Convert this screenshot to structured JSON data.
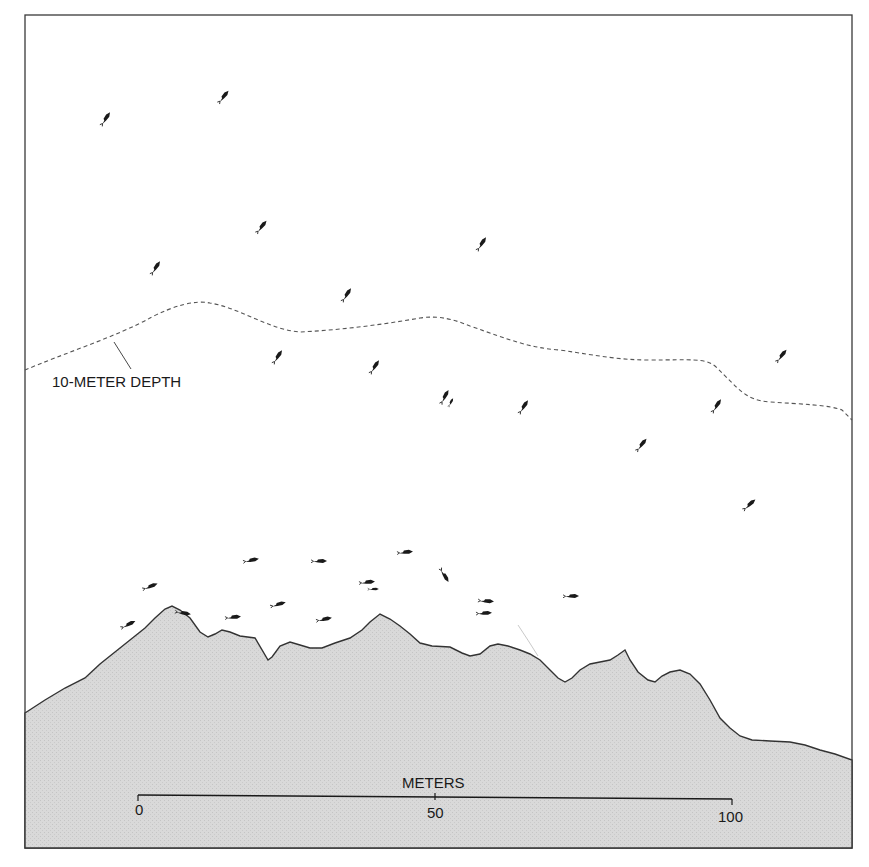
{
  "figure": {
    "colors": {
      "background": "#ffffff",
      "frame": "#3a3a3a",
      "seafloor_fill": "#d6d6d6",
      "seafloor_line": "#333333",
      "depth_line": "#555555",
      "fish": "#1a1a1a"
    }
  },
  "depth_contour": {
    "label": "10-METER DEPTH"
  },
  "scale_bar": {
    "title": "METERS",
    "ticks": [
      {
        "label": "0"
      },
      {
        "label": "50"
      },
      {
        "label": "100"
      }
    ]
  },
  "fish": {
    "upper_water_count": 20,
    "near_bottom_count": 22
  }
}
